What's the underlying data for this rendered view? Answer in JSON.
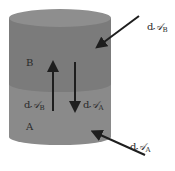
{
  "diagram": {
    "type": "two-layer cylinder flux diagram",
    "colors": {
      "top_ellipse": "#8e8e8e",
      "layer_B": "#7b7b7b",
      "layer_A": "#8a8a8a",
      "arrow": "#1e1e1e",
      "label": "#2a2a2a"
    },
    "layers": [
      {
        "id": "B",
        "label": "B",
        "position": "upper"
      },
      {
        "id": "A",
        "label": "A",
        "position": "lower"
      }
    ],
    "arrows": [
      {
        "id": "external-in-B",
        "label_d": "d",
        "label_sym": "𝒜",
        "label_sub": "B",
        "direction": "into layer B from upper right"
      },
      {
        "id": "internal-up-B",
        "label_d": "d",
        "label_sym": "𝒜",
        "label_sub": "B",
        "direction": "upward from A to B"
      },
      {
        "id": "internal-down-A",
        "label_d": "d",
        "label_sym": "𝒜",
        "label_sub": "A",
        "direction": "downward from B to A"
      },
      {
        "id": "external-in-A",
        "label_d": "d",
        "label_sym": "𝒜",
        "label_sub": "A",
        "direction": "into layer A from lower right"
      }
    ]
  }
}
